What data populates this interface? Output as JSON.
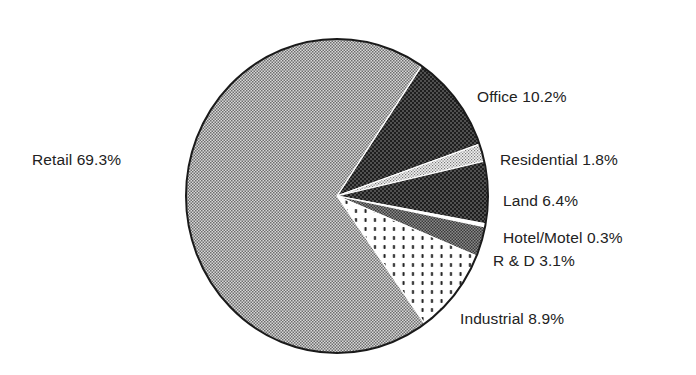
{
  "chart_data": {
    "type": "pie",
    "title": "",
    "start_angle_deg": -56,
    "direction": "clockwise",
    "slices": [
      {
        "label": "Office",
        "value": 10.2,
        "display": "Office 10.2%",
        "pattern": "dark"
      },
      {
        "label": "Residential",
        "value": 1.8,
        "display": "Residential  1.8%",
        "pattern": "light-dots"
      },
      {
        "label": "Land",
        "value": 6.4,
        "display": "Land  6.4%",
        "pattern": "dark"
      },
      {
        "label": "Hotel/Motel",
        "value": 0.3,
        "display": "Hotel/Motel  0.3%",
        "pattern": "white"
      },
      {
        "label": "R & D",
        "value": 3.1,
        "display": "R & D  3.1%",
        "pattern": "medium"
      },
      {
        "label": "Industrial",
        "value": 8.9,
        "display": "Industrial  8.9%",
        "pattern": "dotted"
      },
      {
        "label": "Retail",
        "value": 69.3,
        "display": "Retail  69.3%",
        "pattern": "light-gray"
      }
    ],
    "legend": "none (direct labels)",
    "grid": false
  },
  "labels": {
    "office": "Office 10.2%",
    "residential": "Residential  1.8%",
    "land": "Land  6.4%",
    "hotel": "Hotel/Motel  0.3%",
    "rnd": "R & D  3.1%",
    "industrial": "Industrial  8.9%",
    "retail": "Retail  69.3%"
  },
  "colors": {
    "outline": "#1a1a1a",
    "text": "#222222",
    "background": "#ffffff"
  }
}
